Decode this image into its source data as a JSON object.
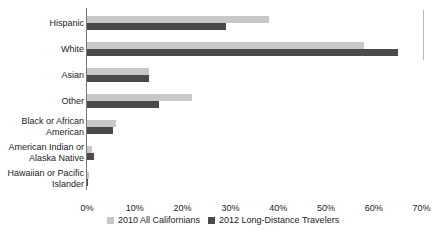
{
  "chart_data": {
    "type": "bar",
    "orientation": "horizontal",
    "title": "",
    "xlabel": "",
    "ylabel": "",
    "xlim": [
      0,
      70
    ],
    "x_ticks": [
      "0%",
      "10%",
      "20%",
      "30%",
      "40%",
      "50%",
      "60%",
      "70%"
    ],
    "grid": false,
    "legend_position": "bottom",
    "categories": [
      "Hispanic",
      "White",
      "Asian",
      "Other",
      "Black or African\nAmerican",
      "American Indian or\nAlaska Native",
      "Hawaiian or Pacific\nIslander"
    ],
    "series": [
      {
        "name": "2010 All Californians",
        "color": "#c8c8c8",
        "values": [
          38,
          58,
          13,
          22,
          6,
          1,
          0.4
        ]
      },
      {
        "name": "2012 Long-Distance Travelers",
        "color": "#4a4a4a",
        "values": [
          29,
          65,
          13,
          15,
          5.5,
          1.5,
          0.3
        ]
      }
    ]
  },
  "legend": {
    "items": [
      {
        "label": "2010 All Californians",
        "color": "#c8c8c8"
      },
      {
        "label": "2012 Long-Distance Travelers",
        "color": "#4a4a4a"
      }
    ]
  }
}
